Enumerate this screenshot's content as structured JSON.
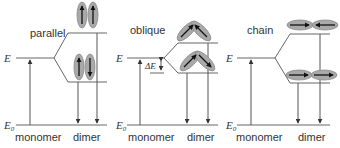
{
  "diagram": {
    "panels": [
      {
        "name": "parallel",
        "label": "parallel",
        "energy_label": "E",
        "ground_label": "E",
        "ground_subscript": "0",
        "monomer_label": "monomer",
        "dimer_label": "dimer",
        "upper_state_dipoles": [
          "up",
          "up"
        ],
        "lower_state_dipoles": [
          "up",
          "down"
        ],
        "allowed_transition": "upper"
      },
      {
        "name": "oblique",
        "label": "oblique",
        "energy_label": "E",
        "ground_label": "E",
        "ground_subscript": "0",
        "monomer_label": "monomer",
        "dimer_label": "dimer",
        "splitting_label": "ΔE",
        "upper_state_dipoles": [
          "up-right",
          "up-left"
        ],
        "lower_state_dipoles": [
          "up-right",
          "down-right"
        ],
        "allowed_transition": "both"
      },
      {
        "name": "chain",
        "label": "chain",
        "energy_label": "E",
        "ground_label": "E",
        "ground_subscript": "0",
        "monomer_label": "monomer",
        "dimer_label": "dimer",
        "upper_state_dipoles": [
          "right",
          "left"
        ],
        "lower_state_dipoles": [
          "right",
          "right"
        ],
        "allowed_transition": "lower"
      }
    ],
    "colors": {
      "line": "#666666",
      "ellipse_fill": "#a9a9a9",
      "dipole_arrow": "#111111",
      "text": "#333333"
    }
  }
}
